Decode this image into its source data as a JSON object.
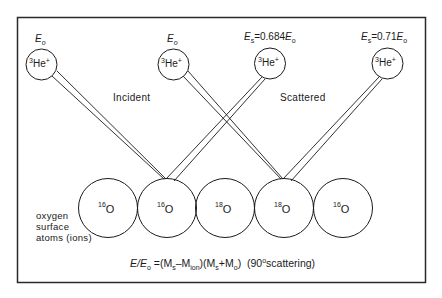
{
  "figure": {
    "frame_color": "#2a2a2a",
    "line_color": "#1a1a1a"
  },
  "ions": [
    {
      "id": "ion-1",
      "mass": "3",
      "symbol": "He",
      "charge": "+",
      "energy_label": {
        "var": "E",
        "sub": "o",
        "eq": "",
        "coef": ""
      }
    },
    {
      "id": "ion-2",
      "mass": "3",
      "symbol": "He",
      "charge": "+",
      "energy_label": {
        "var": "E",
        "sub": "o",
        "eq": "",
        "coef": ""
      }
    },
    {
      "id": "ion-3",
      "mass": "3",
      "symbol": "He",
      "charge": "+",
      "energy_label": {
        "var": "E",
        "sub": "s",
        "eq": "=0.684",
        "rhs_var": "E",
        "rhs_sub": "o"
      }
    },
    {
      "id": "ion-4",
      "mass": "3",
      "symbol": "He",
      "charge": "+",
      "energy_label": {
        "var": "E",
        "sub": "s",
        "eq": "=0.71",
        "rhs_var": "E",
        "rhs_sub": "o"
      }
    }
  ],
  "sections": {
    "incident": "Incident",
    "scattered": "Scattered"
  },
  "atoms": [
    {
      "mass": "16",
      "symbol": "O"
    },
    {
      "mass": "16",
      "symbol": "O"
    },
    {
      "mass": "18",
      "symbol": "O"
    },
    {
      "mass": "18",
      "symbol": "O"
    },
    {
      "mass": "16",
      "symbol": "O"
    }
  ],
  "legend": {
    "line1": "oxygen",
    "line2": "surface",
    "line3": "atoms (ions)"
  },
  "formula": {
    "lhs": "E/E",
    "lhs_sub": "o",
    "eq": " =(M",
    "ms_sub": "s",
    "minus": "–M",
    "ion_sub": "ion",
    "mid": ")(M",
    "ms2_sub": "s",
    "plus": "+M",
    "o_sub": "o",
    "close": ")",
    "note_open": "  (90",
    "deg": "o",
    "note_close": "scattering)"
  }
}
